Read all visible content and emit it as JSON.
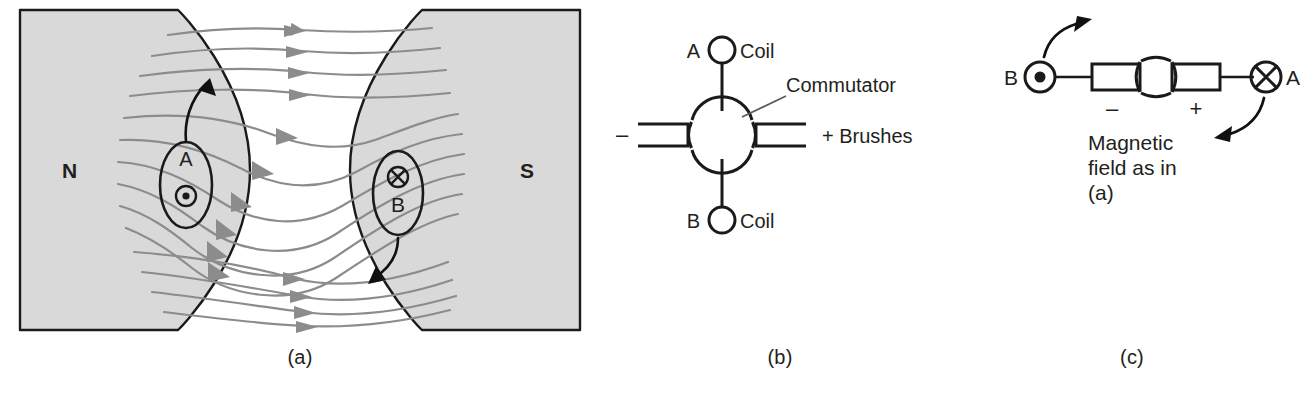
{
  "figure": {
    "background": "#ffffff",
    "ink": "#231f20",
    "magnet_fill": "#d9d9d9",
    "field_line_color": "#8c8c8c"
  },
  "panels": [
    {
      "id": "a",
      "caption": "(a)",
      "name": "magnetic-field-panel",
      "labels": {
        "north_pole": "N",
        "south_pole": "S",
        "conductor_a": "A",
        "conductor_b": "B"
      },
      "conductors": [
        {
          "id": "A",
          "label": "A",
          "current": "out-of-page",
          "symbol": "dot",
          "force": "up"
        },
        {
          "id": "B",
          "label": "B",
          "current": "into-page",
          "symbol": "cross",
          "force": "down"
        }
      ],
      "field": {
        "direction": "left-to-right",
        "from_pole": "N",
        "to_pole": "S",
        "line_count": 15,
        "arrow_count": 15
      }
    },
    {
      "id": "b",
      "caption": "(b)",
      "name": "commutator-schematic-panel",
      "labels": {
        "coil_a": "A",
        "coil_a_text": "Coil",
        "coil_b": "B",
        "coil_b_text": "Coil",
        "commutator": "Commutator",
        "brushes": "+ Brushes",
        "negative": "–"
      }
    },
    {
      "id": "c",
      "caption": "(c)",
      "name": "rotated-commutator-panel",
      "labels": {
        "conductor_b": "B",
        "conductor_a": "A",
        "negative": "–",
        "positive": "+",
        "note_line1": "Magnetic",
        "note_line2": "field as in",
        "note_line3": "(a)"
      },
      "conductors": [
        {
          "id": "B",
          "label": "B",
          "current": "out-of-page",
          "symbol": "dot",
          "force": "up"
        },
        {
          "id": "A",
          "label": "A",
          "current": "into-page",
          "symbol": "cross",
          "force": "down"
        }
      ]
    }
  ]
}
